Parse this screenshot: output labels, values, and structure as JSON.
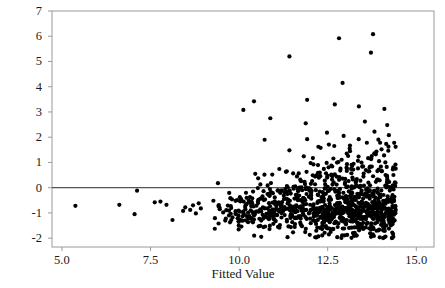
{
  "chart_data": {
    "type": "scatter",
    "title": "",
    "xlabel": "Fitted Value",
    "ylabel": "Standardized Residual",
    "xlim": [
      4.72,
      15.5
    ],
    "ylim": [
      -2.35,
      7.0
    ],
    "xticks": [
      5.0,
      7.5,
      10.0,
      12.5,
      15.0
    ],
    "xticklabels": [
      "5.0",
      "7.5",
      "10.0",
      "12.5",
      "15.0"
    ],
    "yticks": [
      -2,
      -1,
      0,
      1,
      2,
      3,
      4,
      5,
      6,
      7
    ],
    "yticklabels": [
      "-2",
      "-1",
      "0",
      "1",
      "2",
      "3",
      "4",
      "5",
      "6",
      "7"
    ],
    "grid": false,
    "legend": null,
    "reference_line": {
      "orientation": "horizontal",
      "y": 0,
      "color": "#555555",
      "width": 1.2
    },
    "marker": {
      "shape": "circle",
      "color": "#000000",
      "size_px": 4.2
    },
    "frame_color": "#9a9a9a",
    "n_points": 1050,
    "isolated_points": [
      [
        5.38,
        -0.72
      ],
      [
        6.62,
        -0.68
      ],
      [
        7.05,
        -1.05
      ],
      [
        7.12,
        -0.12
      ],
      [
        7.62,
        -0.58
      ],
      [
        7.78,
        -0.55
      ],
      [
        7.95,
        -0.68
      ],
      [
        8.12,
        -1.28
      ],
      [
        8.42,
        -0.92
      ],
      [
        8.48,
        -0.78
      ],
      [
        8.62,
        -0.88
      ],
      [
        8.7,
        -0.7
      ],
      [
        8.78,
        -1.02
      ],
      [
        8.86,
        -0.62
      ],
      [
        8.92,
        -0.82
      ]
    ],
    "high_outliers": [
      [
        13.78,
        6.08
      ],
      [
        12.82,
        5.92
      ],
      [
        11.42,
        5.2
      ],
      [
        13.72,
        5.35
      ],
      [
        12.92,
        4.15
      ],
      [
        11.92,
        3.48
      ],
      [
        10.42,
        3.42
      ],
      [
        12.7,
        3.3
      ],
      [
        13.38,
        3.22
      ],
      [
        14.1,
        3.12
      ],
      [
        10.12,
        3.08
      ],
      [
        10.88,
        2.75
      ],
      [
        13.55,
        2.62
      ],
      [
        11.88,
        2.55
      ],
      [
        12.48,
        2.18
      ],
      [
        12.95,
        2.05
      ],
      [
        11.92,
        1.92
      ],
      [
        10.72,
        1.9
      ],
      [
        13.98,
        1.78
      ],
      [
        14.18,
        2.48
      ],
      [
        13.82,
        2.22
      ],
      [
        12.3,
        1.58
      ],
      [
        11.42,
        1.48
      ],
      [
        13.12,
        1.55
      ],
      [
        14.02,
        1.52
      ]
    ],
    "band": {
      "x_start": 9.05,
      "x_end": 14.42,
      "y_center_start": -0.8,
      "y_center_end": -0.72,
      "y_spread_start": 0.42,
      "y_spread_end": 0.6,
      "y_floor": -2.0,
      "skew_strength": 1.35
    }
  },
  "axes": {
    "frame": {
      "left": 52,
      "top": 11,
      "right": 434,
      "bottom": 247
    }
  }
}
